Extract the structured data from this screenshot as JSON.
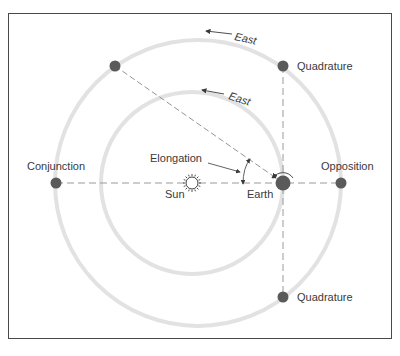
{
  "diagram": {
    "colors": {
      "frame": "#4a4a4a",
      "orbit": "#e2e2e2",
      "planet": "#5a5a5a",
      "dashed_line": "#9a9a9a",
      "text": "#3a3a3a"
    },
    "labels": {
      "east_outer": "East",
      "east_inner": "East",
      "quadrature_top": "Quadrature",
      "quadrature_bottom": "Quadrature",
      "conjunction": "Conjunction",
      "opposition": "Opposition",
      "elongation": "Elongation",
      "sun": "Sun",
      "earth": "Earth"
    },
    "bodies": [
      {
        "name": "Sun",
        "x": 192,
        "y": 183
      },
      {
        "name": "Earth",
        "x": 283,
        "y": 183
      },
      {
        "name": "Conjunction",
        "x": 56,
        "y": 183
      },
      {
        "name": "Opposition",
        "x": 341,
        "y": 183
      },
      {
        "name": "Quadrature (east)",
        "x": 283,
        "y": 66
      },
      {
        "name": "Quadrature (west)",
        "x": 283,
        "y": 297
      },
      {
        "name": "Planet (elongation example)",
        "x": 115,
        "y": 66
      }
    ],
    "orbits": [
      {
        "name": "inner (Earth)",
        "cx": 192,
        "cy": 183,
        "r": 91
      },
      {
        "name": "outer (superior planet)",
        "cx": 198,
        "cy": 183,
        "r": 143
      }
    ]
  }
}
